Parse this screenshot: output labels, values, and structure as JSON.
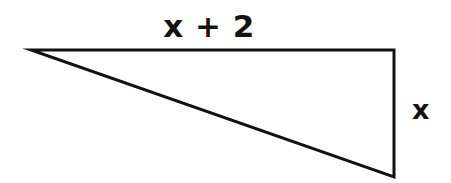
{
  "figure": {
    "kind": "geometry-diagram",
    "shape": "right-triangle",
    "background_color": "#ffffff",
    "stroke_color": "#121212",
    "stroke_width_px": 3,
    "canvas": {
      "width": 451,
      "height": 183
    },
    "vertices": {
      "apex_left": {
        "x": 31,
        "y": 50
      },
      "top_right": {
        "x": 394,
        "y": 50
      },
      "bottom_right": {
        "x": 394,
        "y": 177
      }
    },
    "right_angle_at": "top_right",
    "edges": [
      {
        "name": "top-edge",
        "from": "apex_left",
        "to": "top_right",
        "orientation": "horizontal",
        "label": "x + 2"
      },
      {
        "name": "right-edge",
        "from": "top_right",
        "to": "bottom_right",
        "orientation": "vertical",
        "label": "x"
      },
      {
        "name": "hypotenuse",
        "from": "apex_left",
        "to": "bottom_right",
        "orientation": "diagonal",
        "label": ""
      }
    ]
  },
  "labels": {
    "top_side": "x + 2",
    "right_side": "x"
  }
}
